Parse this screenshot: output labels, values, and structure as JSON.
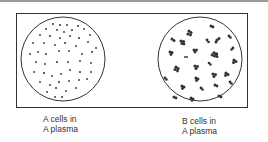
{
  "figure": {
    "panels": [
      {
        "id": "a",
        "label_line1": "A cells in",
        "label_line2": "A plasma",
        "description": "dispersed (non-agglutinated) cells"
      },
      {
        "id": "b",
        "label_line1": "B cells in",
        "label_line2": "A plasma",
        "description": "clumped (agglutinated) cells"
      }
    ],
    "colors": {
      "ink": "#333333",
      "background": "#ffffff",
      "rule": "#9a9a9a"
    }
  }
}
